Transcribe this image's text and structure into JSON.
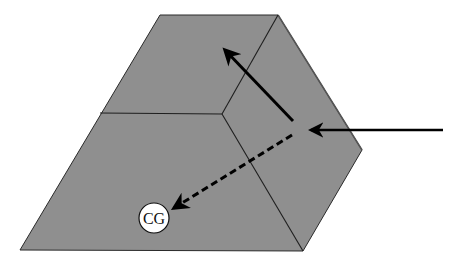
{
  "diagram": {
    "type": "3d-block-force-diagram",
    "colors": {
      "block_fill": "#8f8f8f",
      "outline": "#1e1e1e",
      "arrow": "#000000",
      "cg_fill": "#ffffff",
      "background": "#ffffff"
    },
    "cg_marker": {
      "label": "CG"
    },
    "arrows": [
      {
        "id": "applied-force",
        "style": "solid",
        "direction": "left"
      },
      {
        "id": "tangential-component",
        "style": "solid",
        "direction": "up-left"
      },
      {
        "id": "toward-cg-component",
        "style": "dashed",
        "direction": "down-left toward CG"
      }
    ]
  }
}
